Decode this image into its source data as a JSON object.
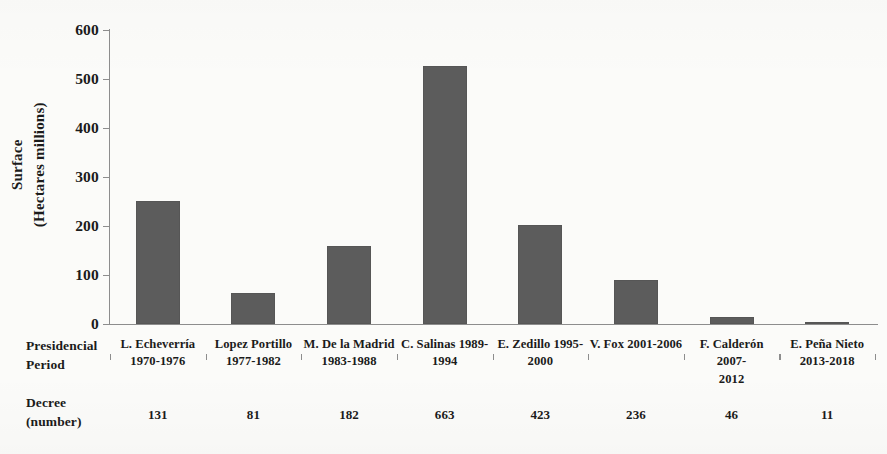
{
  "chart_data": {
    "type": "bar",
    "title": "",
    "xlabel": "Presidencial Period",
    "ylabel": "Surface (Hectares millions)",
    "ylabel_lines": [
      "Surface",
      "(Hectares millions)"
    ],
    "ylim": [
      0,
      600
    ],
    "yticks": [
      0,
      100,
      200,
      300,
      400,
      500,
      600
    ],
    "ytick_labels": [
      "0",
      "100",
      "200",
      "300",
      "400",
      "500",
      "600"
    ],
    "grid": false,
    "legend": null,
    "bar_color": "#5c5c5c",
    "axis_color": "#8d8d8d",
    "background": "#fbfbf9",
    "categories": [
      "L. Echeverría 1970-1976",
      "Lopez Portillo 1977-1982",
      "M. De la Madrid 1983-1988",
      "C. Salinas 1989-1994",
      "E. Zedillo 1995-2000",
      "V. Fox 2001-2006",
      "F. Calderón 2007-2012",
      "E. Peña Nieto 2013-2018"
    ],
    "category_lines": [
      [
        "L. Echeverría",
        "1970-1976"
      ],
      [
        "Lopez Portillo",
        "1977-1982"
      ],
      [
        "M. De la Madrid",
        "1983-1988"
      ],
      [
        "C. Salinas 1989-",
        "1994"
      ],
      [
        "E. Zedillo 1995-",
        "2000"
      ],
      [
        "V. Fox 2001-2006",
        ""
      ],
      [
        "F. Calderón 2007-",
        "2012"
      ],
      [
        "E. Peña Nieto",
        "2013-2018"
      ]
    ],
    "values": [
      252,
      63,
      160,
      527,
      203,
      90,
      14,
      3
    ],
    "series": [
      {
        "name": "Surface (Hectares millions)",
        "values": [
          252,
          63,
          160,
          527,
          203,
          90,
          14,
          3
        ]
      }
    ],
    "decree_numbers": [
      131,
      81,
      182,
      663,
      423,
      236,
      46,
      11
    ]
  },
  "row_headers": {
    "presidencial_period": [
      "Presidencial",
      "Period"
    ],
    "decree": [
      "Decree",
      "(number)"
    ]
  }
}
